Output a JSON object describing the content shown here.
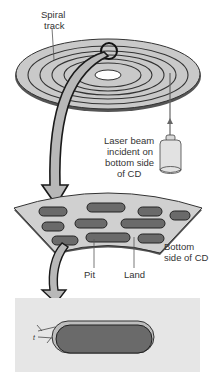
{
  "figure": {
    "colors": {
      "disc_fill": "#c8c8c8",
      "track_line": "#333333",
      "pit_fill": "#6a6a6a",
      "arrow_fill": "#b5b5b5",
      "panel_bg": "#e6e6e6",
      "outline": "#222222"
    }
  },
  "labels": {
    "spiral_track_line1": "Spiral",
    "spiral_track_line2": "track",
    "laser_line1": "Laser beam",
    "laser_line2": "incident on",
    "laser_line3": "bottom side",
    "laser_line4": "of CD",
    "pit": "Pit",
    "land": "Land",
    "bottom_line1": "Bottom",
    "bottom_line2": "side of CD",
    "thickness_symbol": "t"
  }
}
